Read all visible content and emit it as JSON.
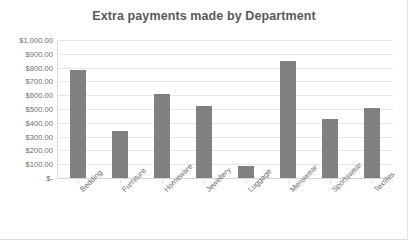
{
  "chart_data": {
    "type": "bar",
    "title": "Extra payments made by Department",
    "xlabel": "",
    "ylabel": "",
    "categories": [
      "Bedding",
      "Furniture",
      "Homeware",
      "Jewellery",
      "Luggage",
      "Menswear",
      "Sportswear",
      "Textiles"
    ],
    "values": [
      780,
      340,
      610,
      520,
      90,
      850,
      430,
      510
    ],
    "ylim": [
      0,
      1000
    ],
    "ytick_values": [
      1000,
      900,
      800,
      700,
      600,
      500,
      400,
      300,
      200,
      100,
      0
    ],
    "ytick_labels": [
      "$1,000.00",
      "$900.00",
      "$800.00",
      "$700.00",
      "$600.00",
      "$500.00",
      "$400.00",
      "$300.00",
      "$200.00",
      "$100.00",
      "$-"
    ],
    "grid": true,
    "legend": "none",
    "bar_color": "#808080",
    "gridline_color": "#e6e6e6",
    "title_color": "#59595b",
    "axis_text_color": "#6f6f6f"
  }
}
